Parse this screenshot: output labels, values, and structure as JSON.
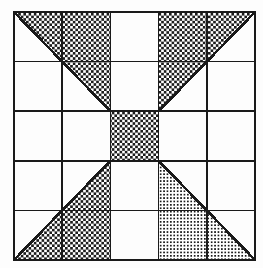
{
  "figure": {
    "grid": {
      "rows": 5,
      "cols": 5,
      "left": 14,
      "top": 12,
      "right": 255,
      "bottom": 260,
      "cell_width": 48.2,
      "cell_height": 49.6,
      "x_lines": [
        14,
        62.2,
        110.4,
        158.6,
        206.8,
        255
      ],
      "y_lines": [
        12,
        61.6,
        111.2,
        160.8,
        210.4,
        260
      ],
      "line_color": "#1a1a1a",
      "outer_line_width": 2.4,
      "inner_line_width": 1.6,
      "diagonal_line_width": 2.6
    },
    "center_cell": {
      "label": "center-cell",
      "col": 2,
      "row": 2,
      "x": 110.4,
      "y": 111.2,
      "width": 48.2,
      "height": 49.6,
      "fill": "coarse-dot"
    },
    "shapes": [
      {
        "name": "top-left-triangle",
        "fill": "coarse-dot",
        "points": "14,12 255,12 255,12 110.4,111.2",
        "vertices": [
          [
            14,
            12
          ],
          [
            110.4,
            111.2
          ],
          [
            14,
            12
          ]
        ],
        "note": "Triangle with apex at grid top-left corner, hypotenuse running to centre-cell top-left corner."
      },
      {
        "name": "top-right-triangle",
        "fill": "coarse-dot",
        "vertices": [
          [
            255,
            12
          ],
          [
            158.6,
            111.2
          ]
        ],
        "note": "Mirror of the top-left triangle about the vertical centre line."
      },
      {
        "name": "bottom-left-triangle",
        "fill": "coarse-dot",
        "vertices": [
          [
            14,
            260
          ],
          [
            110.4,
            160.8
          ]
        ],
        "note": "Triangle with apex at grid bottom-left corner."
      },
      {
        "name": "bottom-right-triangle",
        "fill": "fine-grid",
        "vertices": [
          [
            255,
            260
          ],
          [
            158.6,
            160.8
          ]
        ],
        "note": "Triangle with apex at grid bottom-right corner, filled with a denser cross-hatch than the other three."
      }
    ],
    "patterns": {
      "coarse_dot": {
        "name": "coarse-dot",
        "tile": 5.2,
        "dot_size": 2.6,
        "ink": "#1c1c1c",
        "paper": "#ffffff"
      },
      "fine_grid": {
        "name": "fine-grid",
        "tile": 3.4,
        "dot_size": 2.0,
        "ink": "#1c1c1c",
        "paper": "#ffffff"
      }
    },
    "palette": {
      "ink": "#1a1a1a",
      "paper": "#ffffff",
      "page": "#fdfdfd"
    }
  }
}
